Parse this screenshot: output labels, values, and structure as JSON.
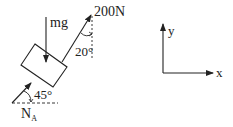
{
  "diagram": {
    "type": "free-body-diagram",
    "colors": {
      "ink": "#222222",
      "background": "#ffffff"
    },
    "forces": {
      "weight": {
        "label": "mg",
        "direction": "down"
      },
      "applied": {
        "label": "200N",
        "angle_label": "20°",
        "angle_reference": "vertical"
      },
      "normal": {
        "label": "N",
        "subscript": "A",
        "angle_label": "45°",
        "angle_reference": "horizontal"
      }
    },
    "axes": {
      "x_label": "x",
      "y_label": "y"
    }
  }
}
